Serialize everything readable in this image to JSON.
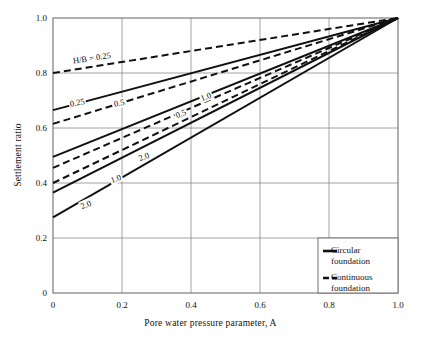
{
  "chart_data": {
    "type": "line",
    "title": "",
    "xlabel": "Pore water pressure parameter, A",
    "ylabel": "Settlement ratio",
    "xlim": [
      0,
      1.0
    ],
    "ylim": [
      0,
      1.0
    ],
    "xticks": [
      "0",
      "0.2",
      "0.4",
      "0.6",
      "0.8",
      "1.0"
    ],
    "xtick_values": [
      0,
      0.2,
      0.4,
      0.6,
      0.8,
      1.0
    ],
    "yticks": [
      "0",
      "0.2",
      "0.4",
      "0.6",
      "0.8",
      "1.0"
    ],
    "ytick_values": [
      0,
      0.2,
      0.4,
      0.6,
      0.8,
      1.0
    ],
    "grid": true,
    "legend_position": "bottom-right",
    "legend": [
      {
        "label": "Circular foundation",
        "style": "solid"
      },
      {
        "label": "Continuous foundation",
        "style": "dashed"
      }
    ],
    "series": [
      {
        "name": "Continuous H/B = 0.25",
        "style": "dashed",
        "hb": "0.25",
        "x": [
          0,
          1.0
        ],
        "values": [
          0.8,
          1.0
        ]
      },
      {
        "name": "Circular H/B = 0.25",
        "style": "solid",
        "hb": "0.25",
        "x": [
          0,
          1.0
        ],
        "values": [
          0.665,
          1.0
        ]
      },
      {
        "name": "Continuous H/B = 0.5",
        "style": "dashed",
        "hb": "0.5",
        "x": [
          0,
          1.0
        ],
        "values": [
          0.615,
          1.0
        ]
      },
      {
        "name": "Circular H/B = 0.5",
        "style": "solid",
        "hb": "0.5",
        "x": [
          0,
          1.0
        ],
        "values": [
          0.495,
          1.0
        ]
      },
      {
        "name": "Continuous H/B = 1.0",
        "style": "dashed",
        "hb": "1.0",
        "x": [
          0,
          1.0
        ],
        "values": [
          0.455,
          1.0
        ]
      },
      {
        "name": "Continuous H/B = 2.0",
        "style": "dashed",
        "hb": "2.0",
        "x": [
          0,
          1.0
        ],
        "values": [
          0.4,
          1.0
        ]
      },
      {
        "name": "Circular H/B = 1.0",
        "style": "solid",
        "hb": "1.0",
        "x": [
          0,
          1.0
        ],
        "values": [
          0.365,
          1.0
        ]
      },
      {
        "name": "Circular H/B = 2.0",
        "style": "solid",
        "hb": "2.0",
        "x": [
          0,
          1.0
        ],
        "values": [
          0.275,
          1.0
        ]
      }
    ],
    "annotations": [
      {
        "text": "H/B = 0.25",
        "x": 0.055,
        "y": 0.845,
        "rotation": -9,
        "target": "Continuous H/B = 0.25"
      },
      {
        "text": "0.25",
        "x": 0.045,
        "y": 0.686,
        "rotation": -11,
        "target": "Circular H/B = 0.25"
      },
      {
        "text": "0.5",
        "x": 0.175,
        "y": 0.686,
        "rotation": -11,
        "target": "Continuous H/B = 0.5"
      },
      {
        "text": "1.0",
        "x": 0.425,
        "y": 0.705,
        "rotation": -23,
        "target": "Continuous H/B = 1.0"
      },
      {
        "text": "0.5",
        "x": 0.355,
        "y": 0.645,
        "rotation": -23,
        "target": "Circular H/B = 0.5"
      },
      {
        "text": "2.0",
        "x": 0.245,
        "y": 0.487,
        "rotation": -23,
        "target": "Continuous H/B = 2.0"
      },
      {
        "text": "1.0",
        "x": 0.165,
        "y": 0.408,
        "rotation": -23,
        "target": "Circular H/B = 1.0"
      },
      {
        "text": "2.0",
        "x": 0.078,
        "y": 0.312,
        "rotation": -23,
        "target": "Circular H/B = 2.0"
      }
    ]
  },
  "legend_box": {
    "circular_line1": "Circular",
    "circular_line2": "foundation",
    "continuous_line1": "Continuous",
    "continuous_line2": "foundation"
  },
  "colors": {
    "line": "#111111",
    "grid": "#8a8a8a",
    "axis": "#6f6f6f",
    "background": "#ffffff",
    "text": "#111111"
  }
}
